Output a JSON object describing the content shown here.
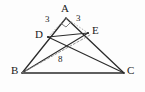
{
  "figure": {
    "canvas": {
      "width": 145,
      "height": 92
    },
    "background_color": "#fdfdfd",
    "stroke_color": "#2b2b2b",
    "dashed_stroke_color": "#8a8a8a",
    "points": [
      {
        "id": "A",
        "label": "A",
        "x": 66,
        "y": 18,
        "label_x": 61,
        "label_y": 4
      },
      {
        "id": "B",
        "label": "B",
        "x": 22,
        "y": 73,
        "label_x": 11,
        "label_y": 66
      },
      {
        "id": "C",
        "label": "C",
        "x": 124,
        "y": 73,
        "label_x": 127,
        "label_y": 66
      },
      {
        "id": "D",
        "label": "D",
        "x": 48,
        "y": 37,
        "label_x": 36,
        "label_y": 30
      },
      {
        "id": "E",
        "label": "E",
        "x": 88,
        "y": 33,
        "label_x": 92,
        "label_y": 26
      }
    ],
    "segments": [
      {
        "from": "A",
        "to": "B",
        "style": "solid",
        "name": "segment-ab"
      },
      {
        "from": "A",
        "to": "C",
        "style": "solid",
        "name": "segment-ac"
      },
      {
        "from": "B",
        "to": "C",
        "style": "solid",
        "name": "segment-bc"
      },
      {
        "from": "D",
        "to": "E",
        "style": "solid",
        "name": "segment-de"
      },
      {
        "from": "D",
        "to": "C",
        "style": "solid",
        "name": "segment-dc"
      },
      {
        "from": "E",
        "to": "B",
        "style": "solid",
        "name": "segment-eb"
      },
      {
        "from": "B",
        "to": "E",
        "style": "dashed",
        "name": "segment-be-dashed"
      },
      {
        "from": "D",
        "to": "B",
        "style": "solid",
        "name": "segment-db"
      }
    ],
    "measures": [
      {
        "id": "ad",
        "value": "3",
        "x": 46,
        "y": 16,
        "name": "measure-ad"
      },
      {
        "id": "ae",
        "value": "3",
        "x": 76,
        "y": 15,
        "name": "measure-ae"
      },
      {
        "id": "be",
        "value": "8",
        "x": 58,
        "y": 56,
        "name": "measure-be"
      }
    ],
    "angle_marks": [
      {
        "at": "A",
        "type": "right-angle",
        "name": "right-angle-mark-a"
      }
    ]
  }
}
